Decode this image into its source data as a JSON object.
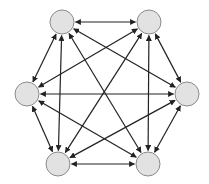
{
  "diagram": {
    "type": "complete-graph",
    "directed": "bidirectional",
    "node_count": 6,
    "colors": {
      "node_fill": "#e2e2e2",
      "node_stroke": "#8a8a8a",
      "edge": "#222222",
      "background": "#ffffff"
    },
    "node_radius": 12,
    "nodes": [
      {
        "id": "n1",
        "x": 62,
        "y": 22
      },
      {
        "id": "n2",
        "x": 149,
        "y": 22
      },
      {
        "id": "n3",
        "x": 27,
        "y": 94
      },
      {
        "id": "n4",
        "x": 187,
        "y": 94
      },
      {
        "id": "n5",
        "x": 58,
        "y": 164
      },
      {
        "id": "n6",
        "x": 148,
        "y": 164
      }
    ],
    "edges": [
      [
        "n1",
        "n2"
      ],
      [
        "n1",
        "n3"
      ],
      [
        "n1",
        "n4"
      ],
      [
        "n1",
        "n5"
      ],
      [
        "n1",
        "n6"
      ],
      [
        "n2",
        "n3"
      ],
      [
        "n2",
        "n4"
      ],
      [
        "n2",
        "n5"
      ],
      [
        "n2",
        "n6"
      ],
      [
        "n3",
        "n4"
      ],
      [
        "n3",
        "n5"
      ],
      [
        "n3",
        "n6"
      ],
      [
        "n4",
        "n5"
      ],
      [
        "n4",
        "n6"
      ],
      [
        "n5",
        "n6"
      ]
    ]
  }
}
